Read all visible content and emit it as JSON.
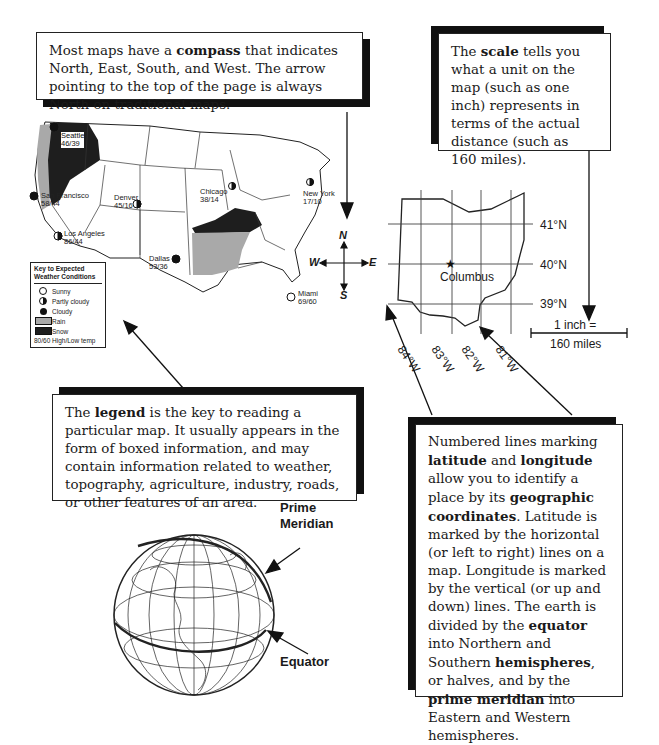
{
  "callouts": {
    "compass": {
      "text_parts": [
        "Most maps have a ",
        "compass",
        " that indicates North, East, South, and West.  The arrow pointing to the top of the page is always North on traditional maps."
      ]
    },
    "scale": {
      "text_parts": [
        "The ",
        "scale",
        " tells you what a unit on the map (such as one inch) represents in terms of the actual distance (such as 160 miles)."
      ]
    },
    "legend": {
      "text_parts": [
        "The ",
        "legend",
        " is the key to reading a particular map.  It usually appears in the form of boxed information, and may contain information related to weather, topography, agriculture, industry, roads, or other features of an area."
      ]
    },
    "latlong": {
      "p1": "Numbered lines marking ",
      "b1": "latitude",
      "p2": " and ",
      "b2": "longitude",
      "p3": " allow you to identify a place by its ",
      "b3": "geographic coordinates",
      "p4": ".  Latitude is marked by the horizontal (or left to right) lines on a map. Longitude is marked by the vertical (or up and down) lines.  The earth is divided by the ",
      "b4": "equator",
      "p5": " into Northern and Southern ",
      "b5": "hemispheres",
      "p6": ", or halves, and by the ",
      "b6": "prime meridian",
      "p7": " into Eastern and Western hemispheres."
    }
  },
  "us_map": {
    "cities": [
      {
        "name": "Seattle",
        "temp": "46/39",
        "condition": "cloudy"
      },
      {
        "name": "San Francisco",
        "temp": "58/44",
        "condition": "cloudy"
      },
      {
        "name": "Los Angeles",
        "temp": "86/44",
        "condition": "partly-cloudy"
      },
      {
        "name": "Denver",
        "temp": "45/16",
        "condition": "partly-cloudy"
      },
      {
        "name": "Chicago",
        "temp": "38/14",
        "condition": "partly-cloudy"
      },
      {
        "name": "New York",
        "temp": "17/10",
        "condition": "partly-cloudy"
      },
      {
        "name": "Dallas",
        "temp": "53/36",
        "condition": "cloudy"
      },
      {
        "name": "Miami",
        "temp": "69/60",
        "condition": "sunny"
      }
    ],
    "legend": {
      "title_line1": "Key to Expected",
      "title_line2": "Weather Conditions",
      "items": [
        {
          "label": "Sunny",
          "symbol": "sunny"
        },
        {
          "label": "Partly cloudy",
          "symbol": "partly-cloudy"
        },
        {
          "label": "Cloudy",
          "symbol": "cloudy"
        },
        {
          "label": "Rain",
          "symbol": "rain"
        },
        {
          "label": "Snow",
          "symbol": "snow"
        }
      ],
      "footer": "80/60 High/Low temp"
    },
    "colors": {
      "rain": "#a9a9a9",
      "snow": "#1e1e1e"
    }
  },
  "compass": {
    "n": "N",
    "s": "S",
    "e": "E",
    "w": "W"
  },
  "ohio_map": {
    "city": "Columbus",
    "latitudes": [
      "41°N",
      "40°N",
      "39°N"
    ],
    "longitudes": [
      "84°W",
      "83°W",
      "82°W",
      "81°W"
    ]
  },
  "scale_bar": {
    "line1": "1 inch =",
    "line2": "160 miles"
  },
  "globe": {
    "prime_meridian_line1": "Prime",
    "prime_meridian_line2": "Meridian",
    "equator": "Equator"
  }
}
